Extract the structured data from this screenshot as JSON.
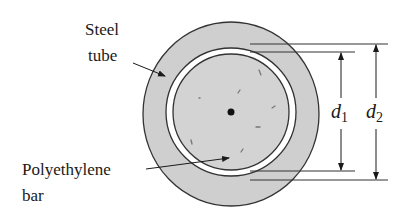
{
  "diagram": {
    "labels": {
      "steel_tube_line1": "Steel",
      "steel_tube_line2": "tube",
      "poly_bar_line1": "Polyethylene",
      "poly_bar_line2": "bar"
    },
    "dimensions": {
      "d1": {
        "symbol": "d",
        "subscript": "1"
      },
      "d2": {
        "symbol": "d",
        "subscript": "2"
      }
    },
    "colors": {
      "tube_fill": "#cfcfcf",
      "bar_fill": "#d3d3d3",
      "outline": "#333333",
      "gap": "#ffffff"
    }
  }
}
